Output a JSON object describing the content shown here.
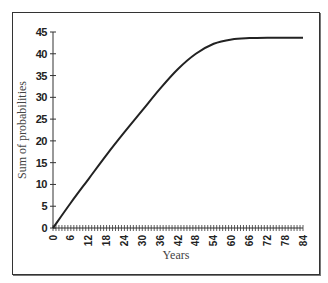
{
  "chart_data": {
    "type": "line",
    "title": "",
    "xlabel": "Years",
    "ylabel": "Sum of probabilities",
    "xlim": [
      0,
      84
    ],
    "ylim": [
      0,
      45
    ],
    "x_ticks": [
      0,
      6,
      12,
      18,
      24,
      30,
      36,
      42,
      48,
      54,
      60,
      66,
      72,
      78,
      84
    ],
    "x_tick_labels": [
      "0",
      "6",
      "12",
      "18",
      "24",
      "30",
      "36",
      "42",
      "48",
      "54",
      "60",
      "66",
      "72",
      "78",
      "84"
    ],
    "x_minor_tick_step": 1,
    "y_ticks": [
      0,
      5,
      10,
      15,
      20,
      25,
      30,
      35,
      40,
      45
    ],
    "y_tick_labels": [
      "0",
      "5",
      "10",
      "15",
      "20",
      "25",
      "30",
      "35",
      "40",
      "45"
    ],
    "grid": false,
    "legend": null,
    "series": [
      {
        "name": "Sum of probabilities",
        "color": "#222222",
        "x": [
          0,
          6,
          12,
          18,
          24,
          30,
          36,
          42,
          48,
          54,
          60,
          66,
          72,
          78,
          84
        ],
        "values": [
          0,
          5.8,
          11.3,
          16.8,
          22.0,
          27.0,
          32.0,
          36.5,
          40.0,
          42.3,
          43.3,
          43.6,
          43.7,
          43.7,
          43.7
        ]
      }
    ]
  }
}
